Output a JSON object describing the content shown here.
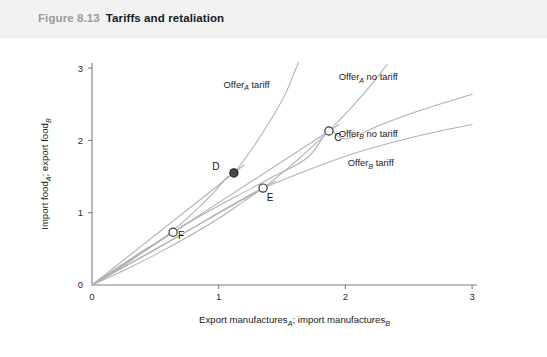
{
  "caption": {
    "number": "Figure 8.13",
    "title": "Tariffs and retaliation"
  },
  "chart_data": {
    "type": "line",
    "title": "Tariffs and retaliation",
    "xlabel_parts": {
      "lead": "Export manufactures",
      "sub1": "A",
      "mid": "; import manufactures",
      "sub2": "B"
    },
    "ylabel_parts": {
      "lead": "Import food",
      "sub1": "A",
      "mid": "; export food",
      "sub2": "B"
    },
    "xlabel": "Export manufacturesA; import manufacturesB",
    "ylabel": "Import foodA; export foodB",
    "xlim": [
      0,
      3
    ],
    "ylim": [
      0,
      3
    ],
    "xticks": [
      0,
      1,
      2,
      3
    ],
    "yticks": [
      0,
      1,
      2,
      3
    ],
    "xtick_labels": [
      "0",
      "1",
      "2",
      "3"
    ],
    "ytick_labels": [
      "0",
      "1",
      "2",
      "3"
    ],
    "grid": false,
    "legend_position": "inline-curve-labels",
    "series": [
      {
        "name": "Offer_A tariff",
        "label_lead": "Offer",
        "label_sub": "A",
        "label_tail": "tariff",
        "label_xy": [
          1.22,
          2.73
        ],
        "points": [
          [
            0.0,
            0.0
          ],
          [
            0.2,
            0.21
          ],
          [
            0.4,
            0.45
          ],
          [
            0.6,
            0.7
          ],
          [
            0.8,
            1.0
          ],
          [
            0.95,
            1.26
          ],
          [
            1.06,
            1.48
          ],
          [
            1.12,
            1.55
          ],
          [
            1.25,
            1.85
          ],
          [
            1.4,
            2.25
          ],
          [
            1.52,
            2.62
          ],
          [
            1.6,
            2.95
          ],
          [
            1.63,
            3.08
          ]
        ]
      },
      {
        "name": "Offer_A no tariff",
        "label_lead": "Offer",
        "label_sub": "A",
        "label_tail": "no tariff",
        "label_xy": [
          2.18,
          2.83
        ],
        "points": [
          [
            0.0,
            0.0
          ],
          [
            0.25,
            0.2
          ],
          [
            0.5,
            0.42
          ],
          [
            0.75,
            0.66
          ],
          [
            1.0,
            0.92
          ],
          [
            1.2,
            1.16
          ],
          [
            1.35,
            1.34
          ],
          [
            1.55,
            1.62
          ],
          [
            1.75,
            1.93
          ],
          [
            1.87,
            2.13
          ],
          [
            2.05,
            2.46
          ],
          [
            2.2,
            2.76
          ],
          [
            2.33,
            3.05
          ]
        ]
      },
      {
        "name": "Offer_B no tariff",
        "label_lead": "Offer",
        "label_sub": "B",
        "label_tail": "no tariff",
        "label_xy": [
          2.18,
          2.05
        ],
        "points": [
          [
            0.0,
            0.0
          ],
          [
            0.2,
            0.24
          ],
          [
            0.4,
            0.47
          ],
          [
            0.64,
            0.73
          ],
          [
            0.85,
            0.95
          ],
          [
            1.12,
            1.21
          ],
          [
            1.4,
            1.47
          ],
          [
            1.7,
            1.76
          ],
          [
            1.87,
            2.13
          ],
          [
            2.0,
            2.02
          ],
          [
            2.3,
            2.23
          ],
          [
            2.6,
            2.42
          ],
          [
            3.0,
            2.64
          ]
        ]
      },
      {
        "name": "Offer_B tariff",
        "label_lead": "Offer",
        "label_sub": "B",
        "label_tail": "tariff",
        "label_xy": [
          2.2,
          1.64
        ],
        "points": [
          [
            0.0,
            0.0
          ],
          [
            0.2,
            0.2
          ],
          [
            0.45,
            0.44
          ],
          [
            0.7,
            0.69
          ],
          [
            1.0,
            1.0
          ],
          [
            1.2,
            1.2
          ],
          [
            1.35,
            1.34
          ],
          [
            1.6,
            1.52
          ],
          [
            1.9,
            1.72
          ],
          [
            2.2,
            1.89
          ],
          [
            2.5,
            2.03
          ],
          [
            2.8,
            2.15
          ],
          [
            3.0,
            2.22
          ]
        ]
      }
    ],
    "rays": [
      {
        "name": "ray-through-C",
        "from": [
          0,
          0
        ],
        "to": [
          1.95,
          2.22
        ]
      },
      {
        "name": "ray-through-D",
        "from": [
          0,
          0
        ],
        "to": [
          1.2,
          1.66
        ]
      },
      {
        "name": "ray-through-E",
        "from": [
          0,
          0
        ],
        "to": [
          1.45,
          1.44
        ]
      },
      {
        "name": "ray-through-F",
        "from": [
          0,
          0
        ],
        "to": [
          0.74,
          0.84
        ]
      }
    ],
    "points": [
      {
        "label": "C",
        "x": 1.87,
        "y": 2.13,
        "marker": "open",
        "label_dx": 9,
        "label_dy": 10
      },
      {
        "label": "D",
        "x": 1.12,
        "y": 1.55,
        "marker": "filled",
        "label_dx": -18,
        "label_dy": -3
      },
      {
        "label": "E",
        "x": 1.35,
        "y": 1.34,
        "marker": "open",
        "label_dx": 7,
        "label_dy": 13
      },
      {
        "label": "F",
        "x": 0.64,
        "y": 0.73,
        "marker": "open",
        "label_dx": 8,
        "label_dy": 7
      }
    ],
    "annotations": [
      "C = free-trade-style outcome on Offer_A no tariff and Offer_B no tariff",
      "D = outcome where Offer_A tariff meets Offer_B no tariff",
      "E = outcome where Offer_A no tariff meets Offer_B tariff",
      "F = mutual retaliation outcome where Offer_A tariff meets Offer_B tariff"
    ]
  }
}
